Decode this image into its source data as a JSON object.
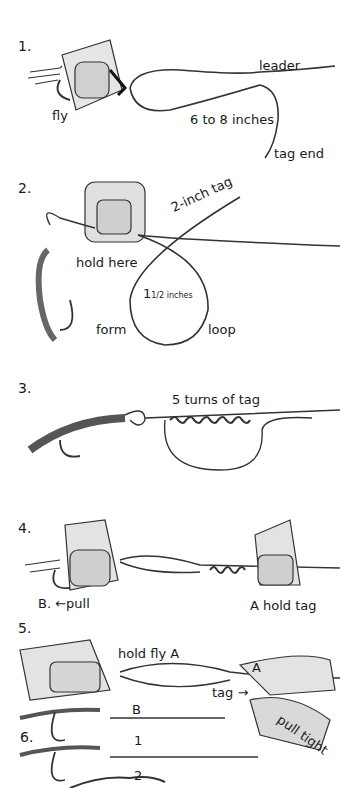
{
  "steps": [
    {
      "number": "1.",
      "labels": {
        "leader": "leader",
        "fly": "fly",
        "length": "6 to 8 inches",
        "tag_end": "tag end"
      }
    },
    {
      "number": "2.",
      "labels": {
        "tag": "2-inch tag",
        "hold": "hold here",
        "loop_size_whole": "1",
        "loop_size_frac": "1/2 inches",
        "form": "form",
        "loop": "loop"
      }
    },
    {
      "number": "3.",
      "labels": {
        "turns": "5 turns of tag"
      }
    },
    {
      "number": "4.",
      "labels": {
        "pull": "B.  ←pull",
        "hold_tag": "A hold tag"
      }
    },
    {
      "number": "5.",
      "labels": {
        "hold_fly": "hold fly A",
        "a": "A",
        "tag": "tag →",
        "pull_tight": "pull tight",
        "b": "B"
      }
    },
    {
      "number": "6.",
      "labels": {
        "one": "1",
        "two": "2"
      }
    }
  ],
  "colors": {
    "ink": "#1a1a1a",
    "line": "#555555",
    "shade": "#bbbbbb"
  }
}
